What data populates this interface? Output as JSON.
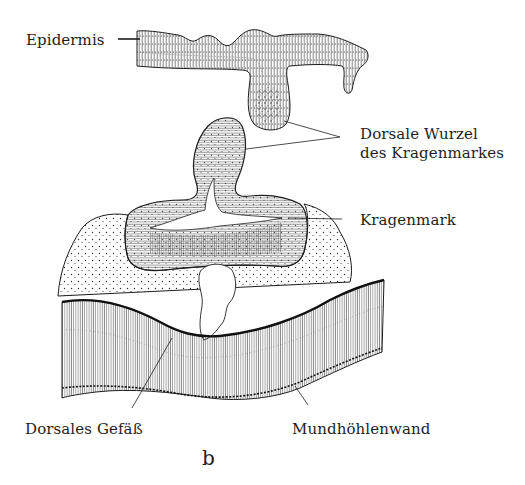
{
  "figure": {
    "panel_letter": "b",
    "colors": {
      "ink": "#1e1e1e",
      "background": "#ffffff",
      "stipple": "#2a2a2a"
    }
  },
  "labels": {
    "epidermis": "Epidermis",
    "dorsal_root_line1": "Dorsale Wurzel",
    "dorsal_root_line2": "des Kragenmarkes",
    "collar_cord": "Kragenmark",
    "dorsal_vessel": "Dorsales Gefäß",
    "mouth_cavity_wall": "Mundhöhlenwand"
  }
}
